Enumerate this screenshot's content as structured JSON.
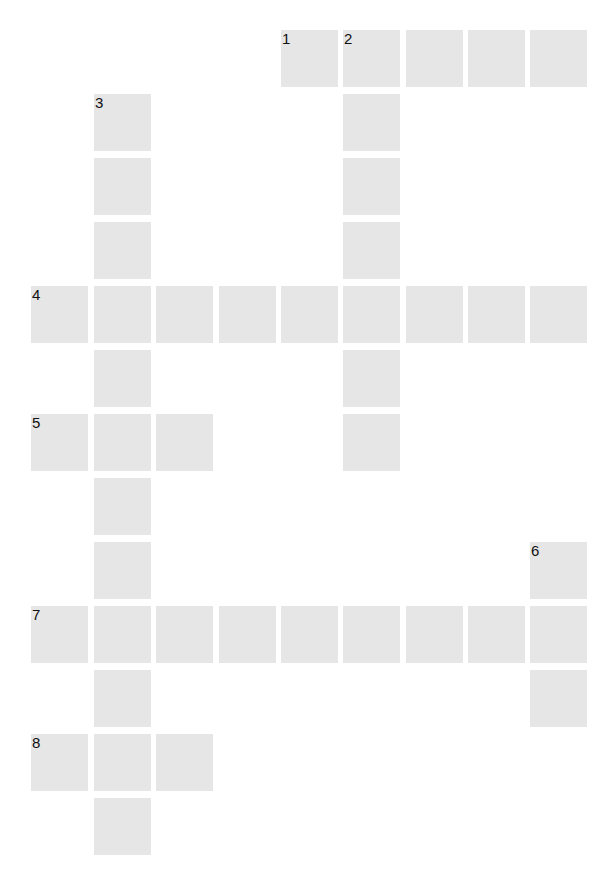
{
  "puzzle": {
    "type": "crossword",
    "cols": 9,
    "rows": 13,
    "cell_color": "#e6e6e6",
    "number_color": "#111111",
    "col_x": [
      31,
      94,
      156,
      219,
      281,
      343,
      406,
      468,
      530
    ],
    "row_y": [
      30,
      94,
      158,
      222,
      286,
      350,
      414,
      478,
      542,
      606,
      670,
      734,
      798
    ],
    "cells": [
      {
        "r": 0,
        "c": 4,
        "n": "1"
      },
      {
        "r": 0,
        "c": 5,
        "n": "2"
      },
      {
        "r": 0,
        "c": 6
      },
      {
        "r": 0,
        "c": 7
      },
      {
        "r": 0,
        "c": 8
      },
      {
        "r": 1,
        "c": 1,
        "n": "3"
      },
      {
        "r": 1,
        "c": 5
      },
      {
        "r": 2,
        "c": 1
      },
      {
        "r": 2,
        "c": 5
      },
      {
        "r": 3,
        "c": 1
      },
      {
        "r": 3,
        "c": 5
      },
      {
        "r": 4,
        "c": 0,
        "n": "4"
      },
      {
        "r": 4,
        "c": 1
      },
      {
        "r": 4,
        "c": 2
      },
      {
        "r": 4,
        "c": 3
      },
      {
        "r": 4,
        "c": 4
      },
      {
        "r": 4,
        "c": 5
      },
      {
        "r": 4,
        "c": 6
      },
      {
        "r": 4,
        "c": 7
      },
      {
        "r": 4,
        "c": 8
      },
      {
        "r": 5,
        "c": 1
      },
      {
        "r": 5,
        "c": 5
      },
      {
        "r": 6,
        "c": 0,
        "n": "5"
      },
      {
        "r": 6,
        "c": 1
      },
      {
        "r": 6,
        "c": 2
      },
      {
        "r": 6,
        "c": 5
      },
      {
        "r": 7,
        "c": 1
      },
      {
        "r": 8,
        "c": 1
      },
      {
        "r": 8,
        "c": 8,
        "n": "6"
      },
      {
        "r": 9,
        "c": 0,
        "n": "7"
      },
      {
        "r": 9,
        "c": 1
      },
      {
        "r": 9,
        "c": 2
      },
      {
        "r": 9,
        "c": 3
      },
      {
        "r": 9,
        "c": 4
      },
      {
        "r": 9,
        "c": 5
      },
      {
        "r": 9,
        "c": 6
      },
      {
        "r": 9,
        "c": 7
      },
      {
        "r": 9,
        "c": 8
      },
      {
        "r": 10,
        "c": 1
      },
      {
        "r": 10,
        "c": 8
      },
      {
        "r": 11,
        "c": 0,
        "n": "8"
      },
      {
        "r": 11,
        "c": 1
      },
      {
        "r": 11,
        "c": 2
      },
      {
        "r": 12,
        "c": 1
      }
    ],
    "clue_numbers": [
      "1",
      "2",
      "3",
      "4",
      "5",
      "6",
      "7",
      "8"
    ]
  }
}
